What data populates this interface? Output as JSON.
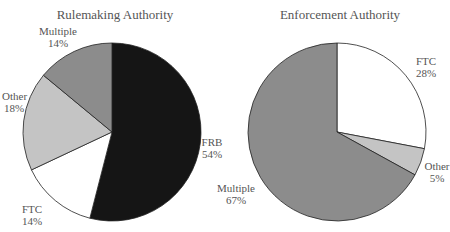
{
  "chart_data": [
    {
      "type": "pie",
      "title": "Rulemaking Authority",
      "slices": [
        {
          "label": "FRB",
          "value": 54,
          "color": "#151515"
        },
        {
          "label": "FTC",
          "value": 14,
          "color": "#ffffff"
        },
        {
          "label": "Other",
          "value": 18,
          "color": "#c4c4c4"
        },
        {
          "label": "Multiple",
          "value": 14,
          "color": "#8c8c8c"
        }
      ],
      "start_angle_deg": 0,
      "direction": "clockwise"
    },
    {
      "type": "pie",
      "title": "Enforcement Authority",
      "slices": [
        {
          "label": "FTC",
          "value": 28,
          "color": "#ffffff"
        },
        {
          "label": "Other",
          "value": 5,
          "color": "#c4c4c4"
        },
        {
          "label": "Multiple",
          "value": 67,
          "color": "#8c8c8c"
        }
      ],
      "start_angle_deg": 0,
      "direction": "clockwise"
    }
  ],
  "labels": {
    "left": {
      "title": "Rulemaking Authority",
      "frb": {
        "name": "FRB",
        "pct": "54%"
      },
      "ftc": {
        "name": "FTC",
        "pct": "14%"
      },
      "other": {
        "name": "Other",
        "pct": "18%"
      },
      "multiple": {
        "name": "Multiple",
        "pct": "14%"
      }
    },
    "right": {
      "title": "Enforcement Authority",
      "ftc": {
        "name": "FTC",
        "pct": "28%"
      },
      "other": {
        "name": "Other",
        "pct": "5%"
      },
      "multiple": {
        "name": "Multiple",
        "pct": "67%"
      }
    }
  }
}
